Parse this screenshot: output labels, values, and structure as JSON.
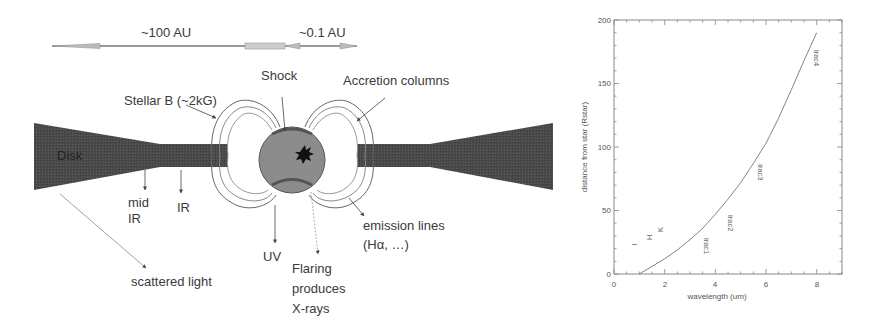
{
  "diagram": {
    "scale_bar": {
      "label_large": "~100 AU",
      "label_small": "~0.1 AU"
    },
    "labels": {
      "disk": "Disk",
      "stellar_b": "Stellar B (~2kG)",
      "shock": "Shock",
      "accretion_columns": "Accretion columns",
      "mid_ir_line1": "mid",
      "mid_ir_line2": "IR",
      "ir": "IR",
      "uv": "UV",
      "flaring_line1": "Flaring",
      "flaring_line2": "produces",
      "flaring_line3": "X-rays",
      "emission_line1": "emission lines",
      "emission_line2": "(Hα, …)",
      "scattered_light": "scattered light"
    },
    "colors": {
      "disk": "#4a4a4a",
      "star": "#8a8a8a",
      "shock_band": "#555555",
      "outline": "#666666"
    }
  },
  "chart_data": {
    "type": "line",
    "title": "",
    "xlabel": "wavelength (um)",
    "ylabel": "distance from star (Rstar)",
    "xlim": [
      0,
      9
    ],
    "ylim": [
      0,
      200
    ],
    "xticks": [
      0,
      2,
      4,
      6,
      8
    ],
    "yticks": [
      0,
      50,
      100,
      150,
      200
    ],
    "xtick_labels": [
      "0",
      "2",
      "4",
      "6",
      "8"
    ],
    "ytick_labels": [
      "0",
      "50",
      "100",
      "150",
      "200"
    ],
    "grid": false,
    "legend": null,
    "series": [
      {
        "name": "distance vs wavelength",
        "x": [
          1.0,
          1.5,
          2.0,
          2.5,
          3.0,
          3.5,
          4.0,
          4.5,
          5.0,
          5.5,
          6.0,
          6.5,
          7.0,
          7.5,
          8.0
        ],
        "y": [
          0,
          6,
          12,
          19,
          27,
          36,
          47,
          59,
          72,
          87,
          103,
          123,
          145,
          168,
          190
        ]
      }
    ],
    "annotations": [
      {
        "text": "I",
        "x": 0.9,
        "y": 23,
        "rotation": -90
      },
      {
        "text": "H",
        "x": 1.5,
        "y": 29,
        "rotation": -90
      },
      {
        "text": "K",
        "x": 1.95,
        "y": 35,
        "rotation": -90
      },
      {
        "text": "irac1",
        "x": 3.55,
        "y": 22,
        "rotation": 90
      },
      {
        "text": "irac2",
        "x": 4.5,
        "y": 40,
        "rotation": 90
      },
      {
        "text": "irac3",
        "x": 5.7,
        "y": 80,
        "rotation": 90
      },
      {
        "text": "irac4",
        "x": 7.9,
        "y": 170,
        "rotation": 90
      }
    ]
  }
}
